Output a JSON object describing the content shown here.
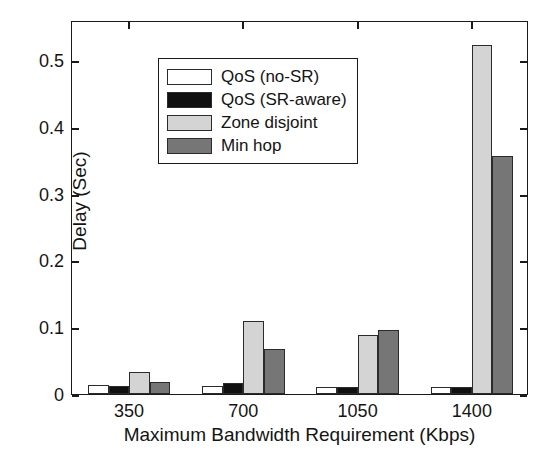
{
  "chart_data": {
    "type": "bar",
    "title": "",
    "xlabel": "Maximum Bandwidth Requirement (Kbps)",
    "ylabel": "Delay (Sec)",
    "categories": [
      "350",
      "700",
      "1050",
      "1400"
    ],
    "series": [
      {
        "name": "QoS (no-SR)",
        "color": "#ffffff",
        "values": [
          0.014,
          0.012,
          0.011,
          0.01
        ]
      },
      {
        "name": "QoS (SR-aware)",
        "color": "#101010",
        "values": [
          0.012,
          0.017,
          0.011,
          0.011
        ]
      },
      {
        "name": "Zone disjoint",
        "color": "#d4d4d4",
        "values": [
          0.033,
          0.11,
          0.089,
          0.522
        ]
      },
      {
        "name": "Min hop",
        "color": "#767676",
        "values": [
          0.018,
          0.067,
          0.096,
          0.357
        ]
      }
    ],
    "ylim": [
      0,
      0.56
    ],
    "yticks": [
      0,
      0.1,
      0.2,
      0.3,
      0.4,
      0.5
    ],
    "ytick_labels": [
      "0",
      "0.1",
      "0.2",
      "0.3",
      "0.4",
      "0.5"
    ],
    "grid": false,
    "legend_position": "upper left",
    "legend_entries": [
      "QoS (no-SR)",
      "QoS (SR-aware)",
      "Zone disjoint",
      "Min hop"
    ]
  }
}
